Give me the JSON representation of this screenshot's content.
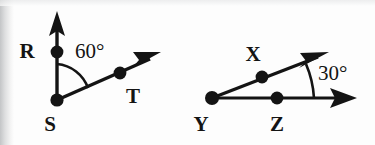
{
  "document": {
    "type": "geometry-diagram",
    "description": "Two labeled angle diagrams drawn with rays, vertex dots and arc angle marks",
    "background_color": "#fdfdfd",
    "ink_color": "#141414"
  },
  "figures": [
    {
      "id": "figure-rst",
      "name": "angle-RST",
      "vertex_label": "S",
      "angle_value": "60°",
      "points": [
        {
          "label": "R",
          "role": "ray-point-upper",
          "cx": 57,
          "cy": 52,
          "label_x": 27,
          "label_y": 58
        },
        {
          "label": "S",
          "role": "vertex",
          "cx": 57,
          "cy": 100,
          "label_x": 48,
          "label_y": 131
        },
        {
          "label": "T",
          "role": "ray-point-lower",
          "cx": 120,
          "cy": 73,
          "label_x": 126,
          "label_y": 103
        }
      ],
      "rays": [
        {
          "name": "ray-SR",
          "x1": 57,
          "y1": 100,
          "x2": 57,
          "y2": 22
        },
        {
          "name": "ray-ST",
          "x1": 57,
          "y1": 100,
          "x2": 150,
          "y2": 59
        }
      ],
      "arrowheads": [
        {
          "name": "arrowhead-SR",
          "tip_x": 57,
          "tip_y": 12,
          "angle_deg": -90
        },
        {
          "name": "arrowhead-ST",
          "tip_x": 160,
          "tip_y": 54,
          "angle_deg": -24
        }
      ],
      "arc": {
        "name": "angle-arc-60",
        "d": "M 57 63 A 37 37 0 0 1 89 89"
      },
      "angle_label_pos": {
        "x": 75,
        "y": 57
      }
    },
    {
      "id": "figure-xyz",
      "name": "angle-XYZ",
      "vertex_label": "Y",
      "angle_value": "30°",
      "points": [
        {
          "label": "X",
          "role": "ray-point-upper",
          "cx": 262,
          "cy": 77,
          "label_x": 251,
          "label_y": 61
        },
        {
          "label": "Y",
          "role": "vertex",
          "cx": 212,
          "cy": 98,
          "label_x": 196,
          "label_y": 131
        },
        {
          "label": "Z",
          "role": "ray-point-lower",
          "cx": 277,
          "cy": 98,
          "label_x": 269,
          "label_y": 131
        }
      ],
      "rays": [
        {
          "name": "ray-YX",
          "x1": 212,
          "y1": 98,
          "x2": 316,
          "y2": 58
        },
        {
          "name": "ray-YZ",
          "x1": 212,
          "y1": 98,
          "x2": 344,
          "y2": 98
        }
      ],
      "arrowheads": [
        {
          "name": "arrowhead-YX",
          "tip_x": 327,
          "tip_y": 53,
          "angle_deg": -21
        },
        {
          "name": "arrowhead-YZ",
          "tip_x": 356,
          "tip_y": 98,
          "angle_deg": 0
        }
      ],
      "arc": {
        "name": "angle-arc-30",
        "d": "M 309 62 A 104 104 0 0 1 316 98"
      },
      "angle_label_pos": {
        "x": 318,
        "y": 79
      }
    }
  ]
}
